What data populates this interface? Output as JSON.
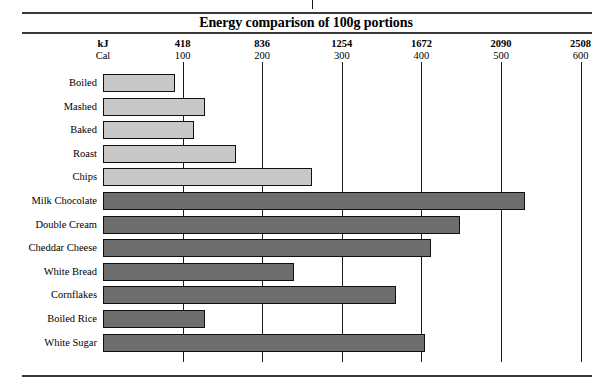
{
  "title": "Energy comparison of 100g portions",
  "axis": {
    "kj_label": "kJ",
    "cal_label": "Cal",
    "kj_ticks": [
      "418",
      "836",
      "1254",
      "1672",
      "2090",
      "2508"
    ],
    "cal_ticks": [
      "100",
      "200",
      "300",
      "400",
      "500",
      "600"
    ]
  },
  "colors": {
    "light_bar": "#c8c8c8",
    "dark_bar": "#6e6e6e",
    "outline": "#101010",
    "rule": "#3a3a3a",
    "background": "#ffffff"
  },
  "chart_data": {
    "type": "bar",
    "orientation": "horizontal",
    "title": "Energy comparison of 100g portions",
    "xlabel": "kJ / Cal",
    "ylabel": "",
    "xlim": [
      0,
      640
    ],
    "grid": true,
    "legend": "none",
    "unit_primary": "kJ",
    "unit_secondary": "Cal",
    "kj_per_cal": 4.18,
    "categories": [
      "Boiled",
      "Mashed",
      "Baked",
      "Roast",
      "Chips",
      "Milk Chocolate",
      "Double Cream",
      "Cheddar Cheese",
      "White Bread",
      "Cornflakes",
      "Boiled Rice",
      "White Sugar"
    ],
    "values": [
      90,
      128,
      114,
      167,
      262,
      530,
      448,
      412,
      240,
      368,
      128,
      404
    ],
    "values_kj": [
      376,
      535,
      476,
      698,
      1095,
      2215,
      1873,
      1722,
      1003,
      1538,
      535,
      1689
    ],
    "series": [
      {
        "name": "Energy per 100g (Cal)",
        "values": [
          90,
          128,
          114,
          167,
          262,
          530,
          448,
          412,
          240,
          368,
          128,
          404
        ]
      }
    ],
    "groups": [
      {
        "name": "Potato dishes",
        "color": "#c8c8c8",
        "categories": [
          "Boiled",
          "Mashed",
          "Baked",
          "Roast",
          "Chips"
        ]
      },
      {
        "name": "Other foods",
        "color": "#6e6e6e",
        "categories": [
          "Milk Chocolate",
          "Double Cream",
          "Cheddar Cheese",
          "White Bread",
          "Cornflakes",
          "Boiled Rice",
          "White Sugar"
        ]
      }
    ]
  }
}
